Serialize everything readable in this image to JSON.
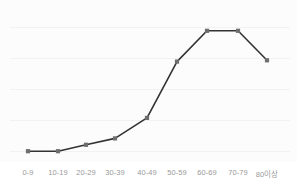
{
  "chart_data": {
    "type": "line",
    "title": "",
    "subtitle": "",
    "xlabel": "",
    "ylabel": "",
    "categories": [
      "0-9",
      "10-19",
      "20-29",
      "30-39",
      "40-49",
      "50-59",
      "60-69",
      "70-79",
      "80이상"
    ],
    "values": [
      3,
      3,
      8,
      13,
      29,
      73,
      97,
      97,
      74
    ],
    "series": [
      {
        "name": "",
        "values": [
          3,
          3,
          8,
          13,
          29,
          73,
          97,
          97,
          74
        ]
      }
    ],
    "ylim": [
      0,
      100
    ],
    "grid": true,
    "gridlines": [
      0,
      25,
      50,
      75,
      100
    ],
    "legend": "none",
    "line_color": "#333333",
    "marker_color": "#6e6e6e",
    "marker_shape": "square",
    "axis_label_color": "#9a9a9a",
    "background_color": "#fcfcfc",
    "gridline_color": "#f2f2f2"
  }
}
